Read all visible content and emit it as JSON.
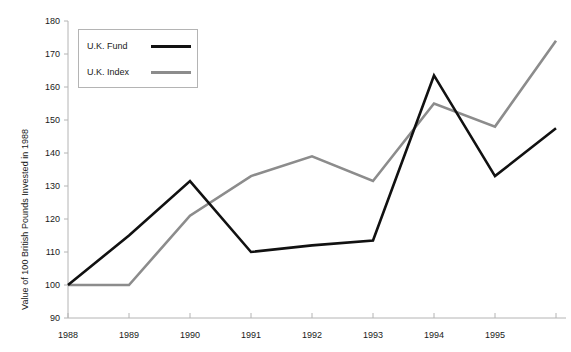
{
  "chart_data": {
    "type": "line",
    "title": "",
    "xlabel": "",
    "ylabel": "Value of 100 British Pounds Invested in 1988",
    "x": [
      1988,
      1989,
      1990,
      1991,
      1992,
      1993,
      1994,
      1995,
      1996
    ],
    "xtick_labels": [
      "1988",
      "1989",
      "1990",
      "1991",
      "1992",
      "1993",
      "1994",
      "1995"
    ],
    "ytick_labels": [
      "90",
      "100",
      "110",
      "120",
      "130",
      "140",
      "150",
      "160",
      "170",
      "180"
    ],
    "ylim": [
      90,
      180
    ],
    "xlim": [
      1988,
      1996
    ],
    "grid": false,
    "legend_position": "upper-left",
    "series": [
      {
        "name": "U.K. Fund",
        "color": "#111111",
        "width": 2.6,
        "values": [
          100,
          115,
          131.5,
          110,
          112,
          113.5,
          163.5,
          133,
          147.5
        ]
      },
      {
        "name": "U.K. Index",
        "color": "#8c8c8c",
        "width": 2.6,
        "values": [
          100,
          100,
          121,
          133,
          139,
          131.5,
          155,
          148,
          174
        ]
      }
    ]
  },
  "axis": {
    "line_color": "#b4b4b4",
    "tick_color": "#b4b4b4"
  }
}
